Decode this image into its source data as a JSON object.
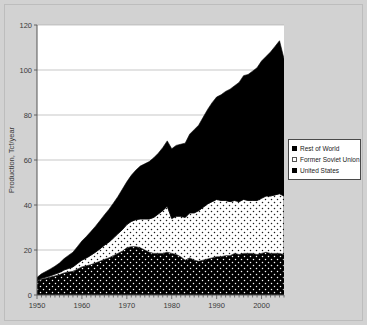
{
  "chart_data": {
    "type": "area",
    "stacked": true,
    "title": "",
    "xlabel": "",
    "ylabel": "Production, Tcf/year",
    "xlim": [
      1950,
      2005
    ],
    "ylim": [
      0,
      120
    ],
    "grid": true,
    "gridlines_y": [
      20,
      40,
      60,
      80,
      100,
      120
    ],
    "x_ticks": [
      1950,
      1960,
      1970,
      1980,
      1990,
      2000
    ],
    "x_tick_labels": [
      "1950",
      "1960",
      "1970",
      "1980",
      "1990",
      "2000"
    ],
    "y_ticks": [
      0,
      20,
      40,
      60,
      80,
      100,
      120
    ],
    "y_tick_labels": [
      "0",
      "20",
      "40",
      "60",
      "80",
      "100",
      "120"
    ],
    "legend_position": "right",
    "x": [
      1950,
      1951,
      1952,
      1953,
      1954,
      1955,
      1956,
      1957,
      1958,
      1959,
      1960,
      1961,
      1962,
      1963,
      1964,
      1965,
      1966,
      1967,
      1968,
      1969,
      1970,
      1971,
      1972,
      1973,
      1974,
      1975,
      1976,
      1977,
      1978,
      1979,
      1980,
      1981,
      1982,
      1983,
      1984,
      1985,
      1986,
      1987,
      1988,
      1989,
      1990,
      1991,
      1992,
      1993,
      1994,
      1995,
      1996,
      1997,
      1998,
      1999,
      2000,
      2001,
      2002,
      2003,
      2004,
      2005
    ],
    "series": [
      {
        "name": "United States",
        "fill": "black-with-white-dots",
        "values": [
          6.0,
          7.0,
          7.5,
          8.0,
          8.5,
          9.0,
          9.8,
          10.2,
          10.5,
          11.5,
          12.5,
          13.0,
          13.5,
          14.2,
          15.0,
          15.8,
          16.5,
          17.5,
          18.5,
          19.5,
          21.0,
          21.5,
          21.5,
          21.0,
          20.0,
          19.0,
          18.5,
          18.5,
          18.5,
          19.0,
          18.5,
          18.0,
          17.0,
          15.5,
          16.5,
          15.5,
          15.0,
          15.5,
          16.0,
          16.5,
          17.0,
          17.0,
          17.5,
          17.5,
          18.5,
          18.0,
          18.5,
          18.5,
          18.5,
          18.0,
          18.5,
          19.0,
          18.5,
          18.5,
          18.5,
          18.0
        ]
      },
      {
        "name": "Former Soviet Union",
        "fill": "white-with-black-dots",
        "values": [
          0.3,
          0.4,
          0.5,
          0.6,
          0.8,
          1.0,
          1.3,
          1.6,
          2.0,
          2.5,
          3.0,
          3.5,
          4.2,
          4.8,
          5.5,
          6.3,
          7.0,
          7.8,
          8.7,
          9.5,
          10.3,
          11.2,
          12.0,
          12.8,
          13.8,
          14.8,
          16.0,
          17.5,
          19.0,
          20.5,
          15.5,
          17.0,
          18.0,
          19.0,
          20.0,
          21.0,
          22.5,
          23.5,
          24.5,
          25.0,
          25.5,
          25.0,
          24.5,
          24.0,
          23.5,
          23.5,
          24.0,
          23.5,
          23.5,
          24.0,
          24.5,
          25.0,
          25.5,
          26.0,
          26.5,
          26.0
        ]
      },
      {
        "name": "Rest of World",
        "fill": "solid-black",
        "values": [
          1.5,
          2.0,
          2.5,
          3.0,
          3.5,
          4.2,
          5.0,
          5.8,
          6.5,
          7.5,
          8.5,
          9.5,
          10.5,
          11.5,
          12.5,
          13.5,
          14.5,
          15.5,
          16.5,
          18.0,
          19.0,
          20.5,
          22.0,
          23.5,
          24.5,
          25.5,
          26.5,
          27.0,
          28.0,
          29.0,
          31.0,
          31.5,
          32.0,
          33.0,
          35.0,
          37.0,
          38.0,
          40.0,
          42.0,
          44.0,
          45.5,
          47.0,
          48.5,
          50.0,
          51.0,
          53.0,
          55.0,
          56.0,
          57.5,
          59.0,
          61.0,
          62.0,
          64.0,
          66.0,
          68.0,
          61.0
        ]
      }
    ]
  },
  "legend": {
    "items": [
      {
        "label": "Rest of World",
        "swatch": "solid-black-swatch"
      },
      {
        "label": "Former Soviet Union",
        "swatch": "white-dotted-swatch"
      },
      {
        "label": "United States",
        "swatch": "black-dotted-swatch"
      }
    ]
  },
  "colors": {
    "page_background": "#d2d2d2",
    "plot_background": "#ffffff",
    "axis": "#555555",
    "gridline": "#b0b0b0",
    "series_dark": "#000000",
    "series_light": "#ffffff"
  }
}
